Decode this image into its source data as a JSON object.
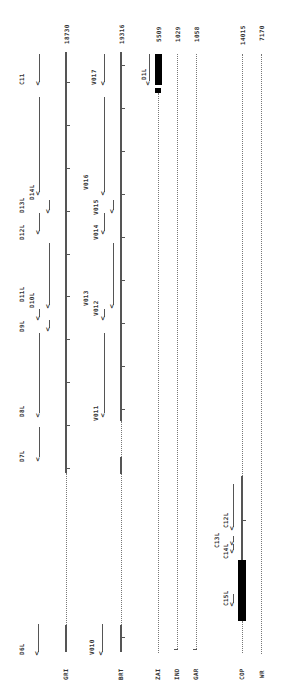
{
  "tracks": [
    {
      "label": "GRI",
      "length": "18730",
      "x": 66
    },
    {
      "label": "BRT",
      "length": "19316",
      "x": 121
    },
    {
      "label": "ZAI",
      "length": "5509",
      "x": 158
    },
    {
      "label": "IND",
      "length": "1029",
      "x": 177
    },
    {
      "label": "GAR",
      "length": "1058",
      "x": 196
    },
    {
      "label": "COP",
      "length": "14015",
      "x": 242
    },
    {
      "label": "WR",
      "length": "7170",
      "x": 261
    }
  ],
  "gri_features": [
    "D6L",
    "D7L",
    "D8L",
    "D9L",
    "D10L",
    "D11L",
    "D12L",
    "D13L",
    "D14L",
    "C11"
  ],
  "brt_features": [
    "V010",
    "V011",
    "V012",
    "V013",
    "V014",
    "V015",
    "V016",
    "V017"
  ],
  "zai_features": [
    "D1L"
  ],
  "cop_features": [
    "C15L",
    "C14L",
    "C13L",
    "C12L"
  ],
  "arrow_glyph": "<"
}
